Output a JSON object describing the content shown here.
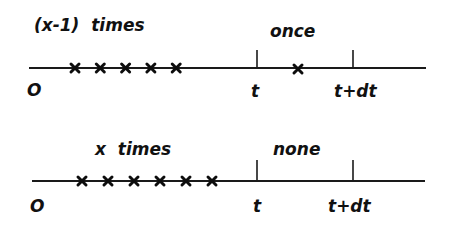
{
  "diagram": {
    "panels": [
      {
        "id": "top",
        "count_label": "(x-1)  times",
        "interval_label": "once",
        "origin_label": "O",
        "t_label": "t",
        "tdt_label": "t+dt",
        "events_before_t": 5,
        "events_in_interval": 1
      },
      {
        "id": "bottom",
        "count_label": "x  times",
        "interval_label": "none",
        "origin_label": "O",
        "t_label": "t",
        "tdt_label": "t+dt",
        "events_before_t": 6,
        "events_in_interval": 0
      }
    ]
  }
}
